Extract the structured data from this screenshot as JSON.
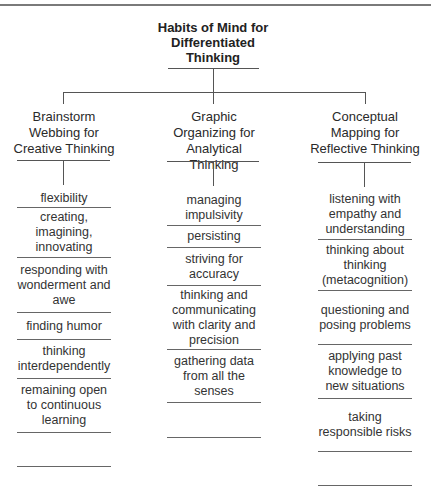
{
  "title": "Habits of Mind for Differentiated Thinking",
  "columns": [
    {
      "heading": "Brainstorm Webbing for Creative Thinking",
      "items": [
        "flexibility",
        "creating, imagining, innovating",
        "responding with wonderment and awe",
        "finding humor",
        "thinking interdependently",
        "remaining open to continuous learning",
        ""
      ]
    },
    {
      "heading": "Graphic Organizing for Analytical Thinking",
      "items": [
        "managing impulsivity",
        "persisting",
        "striving for accuracy",
        "thinking and communicating with clarity and precision",
        "gathering data from all the senses",
        ""
      ]
    },
    {
      "heading": "Conceptual Mapping for Reflective Thinking",
      "items": [
        "listening with empathy and understanding",
        "thinking about thinking (metacognition)",
        "questioning and posing problems",
        "applying past knowledge to new situations",
        "taking responsible risks",
        ""
      ]
    }
  ]
}
